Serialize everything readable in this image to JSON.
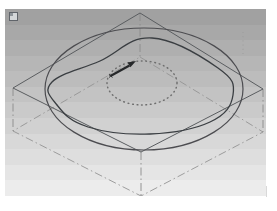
{
  "viewport": {
    "background_gradient_top": "#a1a1a1",
    "background_gradient_bottom": "#ececec",
    "page_background": "#ffffff",
    "corner_icon": "sketch-plane-icon"
  },
  "colors": {
    "plane_edge": "#5a5d60",
    "construction": "#8a8a8a",
    "hidden_construction": "#949494",
    "ellipse": "#4c4c50",
    "spline": "#3a3e42",
    "circle_dotted": "#6f6f6f",
    "arrow": "#26282a",
    "faint_mark": "#9b9b9b",
    "icon_border": "#60646a",
    "icon_fill": "#d4d7d9",
    "icon_accent": "#8f959a"
  }
}
